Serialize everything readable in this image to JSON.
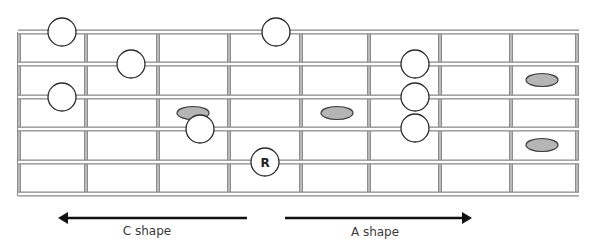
{
  "diagram": {
    "type": "guitar-fretboard",
    "board": {
      "left": 19,
      "right": 577,
      "top": 32,
      "bottom": 194
    },
    "strings_y": [
      32,
      64,
      97,
      129,
      162,
      194
    ],
    "frets_x": [
      19,
      86,
      158,
      229,
      301,
      369,
      440,
      511,
      577
    ],
    "colors": {
      "line_outer": "#8c8c8c",
      "line_inner": "#ffffff",
      "note_fill": "#ffffff",
      "note_stroke": "#2b2b2b",
      "passing_fill": "#b5b5b5",
      "passing_stroke": "#3a3a3a",
      "arrow": "#111111",
      "text": "#3a3a3a"
    },
    "notes": [
      {
        "x": 62,
        "y": 32,
        "label": ""
      },
      {
        "x": 276,
        "y": 32,
        "label": ""
      },
      {
        "x": 131,
        "y": 64,
        "label": ""
      },
      {
        "x": 415,
        "y": 64,
        "label": ""
      },
      {
        "x": 62,
        "y": 97,
        "label": ""
      },
      {
        "x": 415,
        "y": 97,
        "label": ""
      },
      {
        "x": 200,
        "y": 129,
        "label": ""
      },
      {
        "x": 415,
        "y": 128,
        "label": ""
      },
      {
        "x": 265,
        "y": 162,
        "label": "R"
      }
    ],
    "passing_notes": [
      {
        "x": 193,
        "y": 113
      },
      {
        "x": 337,
        "y": 113
      },
      {
        "x": 542,
        "y": 80
      },
      {
        "x": 542,
        "y": 145
      }
    ],
    "arrows": [
      {
        "name": "c-shape-arrow",
        "x1": 247,
        "x2": 58,
        "y": 218,
        "label": "C shape",
        "label_x": 147,
        "label_y": 235
      },
      {
        "name": "a-shape-arrow",
        "x1": 285,
        "x2": 472,
        "y": 218,
        "label": "A shape",
        "label_x": 375,
        "label_y": 236
      }
    ]
  },
  "labels": {
    "root": "R",
    "c_shape": "C shape",
    "a_shape": "A shape"
  }
}
